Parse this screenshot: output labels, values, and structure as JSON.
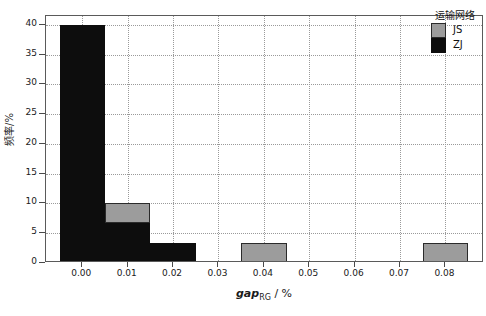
{
  "chart_data": {
    "type": "bar",
    "title": "",
    "xlabel": "gapRG / %",
    "xlabel_parts": {
      "italic": "gap",
      "subscript": "RG",
      "suffix": " / %"
    },
    "ylabel": "频率/%",
    "xlim": [
      -0.008,
      0.0885
    ],
    "ylim": [
      0,
      41.5
    ],
    "xticks": [
      "0.00",
      "0.01",
      "0.02",
      "0.03",
      "0.04",
      "0.05",
      "0.06",
      "0.07",
      "0.08"
    ],
    "xtick_values": [
      0.0,
      0.01,
      0.02,
      0.03,
      0.04,
      0.05,
      0.06,
      0.07,
      0.08
    ],
    "yticks": [
      "0",
      "5",
      "10",
      "15",
      "20",
      "25",
      "30",
      "35",
      "40"
    ],
    "ytick_values": [
      0,
      5,
      10,
      15,
      20,
      25,
      30,
      35,
      40
    ],
    "grid": true,
    "stacked": true,
    "bin_width": 0.01,
    "bin_centers": [
      0.0,
      0.01,
      0.02,
      0.03,
      0.04,
      0.05,
      0.06,
      0.07,
      0.08
    ],
    "series": [
      {
        "name": "ZJ",
        "color": "#0d0d0d",
        "values": [
          40.0,
          6.7,
          3.3,
          0,
          0,
          0,
          0,
          0,
          0
        ]
      },
      {
        "name": "JS",
        "color": "#9c9c9c",
        "values": [
          0,
          3.3,
          0,
          0,
          3.3,
          0,
          0,
          0,
          3.3
        ]
      }
    ],
    "legend": {
      "title": "运输网络",
      "position": "top-right",
      "entries": [
        {
          "label": "JS",
          "color": "#9c9c9c"
        },
        {
          "label": "ZJ",
          "color": "#0d0d0d"
        }
      ]
    }
  },
  "colors": {
    "js": "#9c9c9c",
    "zj": "#0d0d0d",
    "axis": "#5a5a5a",
    "grid": "#9a9a9a",
    "background": "#ffffff"
  }
}
